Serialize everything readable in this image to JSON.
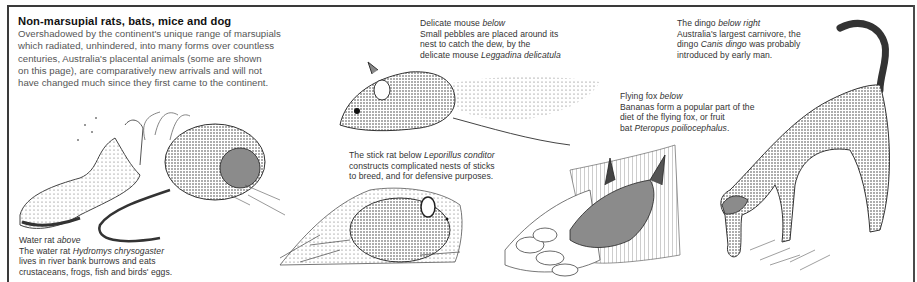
{
  "intro": {
    "title": "Non-marsupial rats, bats, mice   and dog",
    "body": [
      "Overshadowed by the continent's unique range of marsupials",
      "which radiated, unhindered, into many forms over countless",
      "centuries, Australia's placental animals (some are shown",
      "on this page), are comparatively new arrivals and will not",
      "have changed much since they first came to the continent."
    ]
  },
  "captions": {
    "delicate_mouse": {
      "heading": "Delicate mouse",
      "heading_dir": "below",
      "line1": "Small pebbles are placed around its",
      "line2": "nest to catch the dew, by the",
      "line3_pre": "delicate mouse",
      "species": "Leggadina delicatula"
    },
    "dingo": {
      "heading": "The dingo",
      "heading_dir": "below right",
      "line1": "Australia's largest carnivore, the",
      "line2_pre": "dingo",
      "species": "Canis dingo",
      "line2_post": "was probably",
      "line3": "introduced by early man."
    },
    "flying_fox": {
      "heading": "Flying fox",
      "heading_dir": "below",
      "line1": "Bananas form a popular part of the",
      "line2": "diet of the flying fox, or fruit",
      "line3_pre": "bat",
      "species": "Pteropus poiliocephalus",
      "line3_post": "."
    },
    "stick_rat": {
      "heading_pre": "The stick rat below",
      "species": "Leporillus conditor",
      "line2": "constructs complicated nests of sticks",
      "line3": "to breed, and for defensive purposes."
    },
    "water_rat": {
      "heading": "Water rat",
      "heading_dir": "above",
      "line1_pre": "The water rat",
      "species": "Hydromys chrysogaster",
      "line2": "lives in river bank burrows and eats",
      "line3": "crustaceans, frogs, fish and birds' eggs."
    }
  },
  "illustrations": [
    {
      "id": "water-rat",
      "label": "water rat among reeds on river bank"
    },
    {
      "id": "delicate-mouse",
      "label": "delicate mouse beside pebble scatter"
    },
    {
      "id": "stick-rat",
      "label": "stick rat on nest of sticks"
    },
    {
      "id": "flying-fox",
      "label": "flying fox eating bananas"
    },
    {
      "id": "dingo",
      "label": "dingo sniffing ground"
    }
  ]
}
